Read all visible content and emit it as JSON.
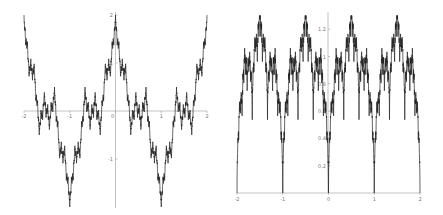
{
  "chart_data": [
    {
      "type": "line",
      "title": "",
      "xlabel": "",
      "ylabel": "",
      "xlim": [
        -2,
        2
      ],
      "ylim": [
        -2,
        2
      ],
      "x_ticks": [
        "-2",
        "-1",
        "0",
        "1",
        "2"
      ],
      "y_ticks": [
        "2",
        "1",
        "-1"
      ],
      "grid": false,
      "legend": null,
      "description": "Weierstrass-type fractal oscillation, period 2, peaks near x = -2, -1.1, 0, 1, 2 reaching ~2, troughs near x = -1.5, -0.5, 0.5, 1.5 reaching ~-2",
      "series": [
        {
          "name": "f(x)",
          "generator": {
            "kind": "cos_sum",
            "a": 0.5,
            "b": 3,
            "terms": 10,
            "scale": 1.0
          }
        }
      ],
      "color": "#222222"
    },
    {
      "type": "line",
      "title": "",
      "xlabel": "",
      "ylabel": "",
      "xlim": [
        -2,
        2
      ],
      "ylim": [
        0,
        1.3
      ],
      "x_ticks": [
        "-2",
        "-1",
        "0",
        "1",
        "2"
      ],
      "y_ticks": [
        "0.2",
        "0.4",
        "0.6",
        "0.8",
        "1",
        "1.2"
      ],
      "grid": false,
      "legend": null,
      "description": "Fractal curve with deep cusps at x = -1 (~0.05), 0 (~0.0), 1 (~0.3), endpoints ~0.6-0.8, maxima ~1.3 near x = -1.7, -1.35, -0.7, 0.35, 0.6, 1.4, 1.6",
      "series": [
        {
          "name": "g(x)",
          "generator": {
            "kind": "abs_sin_sum",
            "a": 0.55,
            "b": 3,
            "terms": 9
          }
        }
      ],
      "color": "#222222"
    }
  ]
}
